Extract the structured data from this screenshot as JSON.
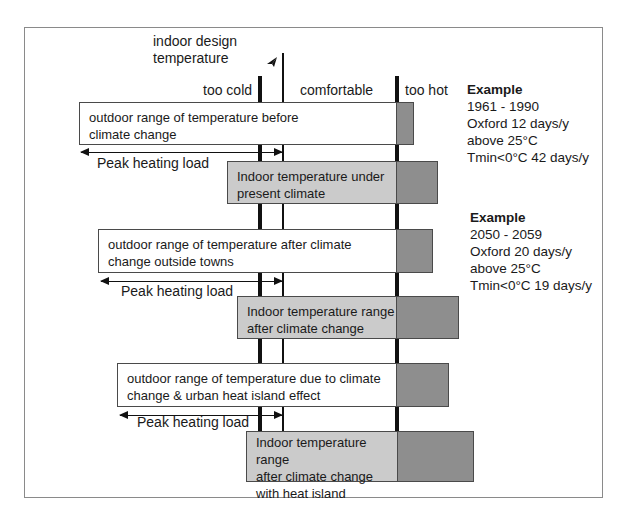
{
  "diagram": {
    "design_temp_label": [
      "indoor design",
      "temperature"
    ],
    "zones": {
      "too_cold": "too cold",
      "comfortable": "comfortable",
      "too_hot": "too hot"
    },
    "scenarios": [
      {
        "outdoor_label": [
          "outdoor range of temperature before",
          "climate change"
        ],
        "peak_label": "Peak heating load",
        "indoor_label": [
          "Indoor temperature under",
          "present climate"
        ]
      },
      {
        "outdoor_label": [
          "outdoor range of temperature after climate",
          "change outside towns"
        ],
        "peak_label": "Peak heating load",
        "indoor_label": [
          "Indoor temperature range",
          "after climate change"
        ]
      },
      {
        "outdoor_label": [
          "outdoor range of temperature due to climate",
          "change & urban heat island effect"
        ],
        "peak_label": "Peak heating load",
        "indoor_label": [
          "Indoor temperature range",
          "after climate change",
          "with heat  island"
        ]
      }
    ],
    "examples": [
      {
        "title": "Example",
        "lines": [
          "1961 - 1990",
          "Oxford 12 days/y",
          "above 25°C",
          "Tmin<0°C 42 days/y"
        ]
      },
      {
        "title": "Example",
        "lines": [
          "2050 - 2059",
          "Oxford 20 days/y",
          "above 25°C",
          "Tmin<0°C 19 days/y"
        ]
      }
    ],
    "colors": {
      "outdoor_fill": "#ffffff",
      "indoor_fill": "#cbcbcb",
      "too_hot_fill": "#8e8e8e",
      "line": "#111111",
      "frame": "#8a8a8a"
    }
  }
}
